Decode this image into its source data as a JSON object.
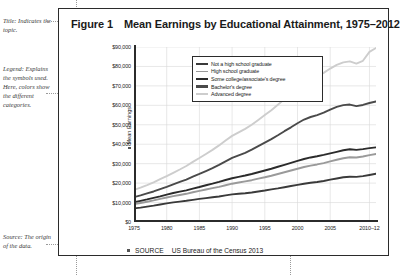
{
  "annotations": [
    {
      "id": "title-note",
      "label": "Title:",
      "text": "Indicates the topic."
    },
    {
      "id": "legend-note",
      "label": "Legend:",
      "text": "Explains the symbols used. Here, colors show the different categories."
    },
    {
      "id": "source-note",
      "label": "Source:",
      "text": "The origin of the data."
    }
  ],
  "figure": {
    "label": "Figure 1",
    "title": "Mean Earnings by Educational Attainment, 1975–2012",
    "source_word": "SOURCE",
    "source_text": "US Bureau of the Census 2013"
  },
  "chart_data": {
    "type": "line",
    "title": "Mean Earnings by Educational Attainment, 1975–2012",
    "xlabel": "",
    "ylabel": "Mean Earnings",
    "xlim": [
      1975,
      2012
    ],
    "ylim": [
      0,
      90000
    ],
    "grid": true,
    "legend_position": "top-left-inside",
    "ytick_labels": [
      "$90,000",
      "$80,000",
      "$70,000",
      "$60,000",
      "$50,000",
      "$40,000",
      "$30,000",
      "$20,000",
      "$10,000",
      "$0"
    ],
    "ytick_values": [
      90000,
      80000,
      70000,
      60000,
      50000,
      40000,
      30000,
      20000,
      10000,
      0
    ],
    "xtick_labels": [
      "1975",
      "1980",
      "1985",
      "1990",
      "1995",
      "2000",
      "2005",
      "2010–12"
    ],
    "xtick_values": [
      1975,
      1980,
      1985,
      1990,
      1995,
      2000,
      2005,
      2011
    ],
    "x": [
      1975,
      1976,
      1977,
      1978,
      1979,
      1980,
      1981,
      1982,
      1983,
      1984,
      1985,
      1986,
      1987,
      1988,
      1989,
      1990,
      1991,
      1992,
      1993,
      1994,
      1995,
      1996,
      1997,
      1998,
      1999,
      2000,
      2001,
      2002,
      2003,
      2004,
      2005,
      2006,
      2007,
      2008,
      2009,
      2010,
      2011,
      2012
    ],
    "series": [
      {
        "name": "Not a high school graduate",
        "color": "#3a3a3a",
        "values": [
          7000,
          7400,
          7900,
          8400,
          9000,
          9600,
          10100,
          10500,
          10900,
          11400,
          11900,
          12300,
          12700,
          13100,
          13700,
          14200,
          14500,
          14800,
          15200,
          15700,
          16200,
          16800,
          17300,
          17900,
          18500,
          19100,
          19700,
          20200,
          20600,
          21100,
          21800,
          22400,
          23000,
          23300,
          23200,
          23600,
          24200,
          24800
        ]
      },
      {
        "name": "High school graduate",
        "color": "#9a9a9a",
        "values": [
          9200,
          9800,
          10400,
          11100,
          11900,
          12600,
          13300,
          13900,
          14500,
          15300,
          16000,
          16700,
          17400,
          18100,
          18900,
          19700,
          20300,
          20900,
          21500,
          22300,
          23000,
          23800,
          24700,
          25600,
          26500,
          27400,
          28300,
          29000,
          29600,
          30300,
          31200,
          32000,
          32800,
          33300,
          33200,
          33700,
          34400,
          35000
        ]
      },
      {
        "name": "Some college/associate's degree",
        "color": "#2b2b2b",
        "values": [
          10200,
          10900,
          11600,
          12400,
          13200,
          14100,
          14900,
          15600,
          16300,
          17200,
          18000,
          18900,
          19700,
          20600,
          21600,
          22500,
          23200,
          23900,
          24700,
          25600,
          26500,
          27400,
          28400,
          29400,
          30400,
          31400,
          32400,
          33200,
          33800,
          34500,
          35300,
          36100,
          36900,
          37400,
          37100,
          37500,
          38000,
          38400
        ]
      },
      {
        "name": "Bachelor's degree",
        "color": "#4a4a4a",
        "values": [
          12800,
          13700,
          14700,
          15700,
          16900,
          18100,
          19400,
          20600,
          21800,
          23300,
          24700,
          26200,
          27700,
          29400,
          31200,
          33000,
          34300,
          35600,
          37200,
          39000,
          40800,
          42600,
          44600,
          46700,
          48700,
          50800,
          52700,
          54000,
          55000,
          56200,
          57800,
          59200,
          60100,
          60400,
          59600,
          60200,
          61200,
          62000
        ]
      },
      {
        "name": "Advanced degree",
        "color": "#cdcdcd",
        "values": [
          16500,
          17700,
          19000,
          20400,
          22000,
          23600,
          25300,
          27000,
          28800,
          30900,
          32900,
          35000,
          37100,
          39400,
          41900,
          44300,
          46100,
          47900,
          50000,
          52500,
          55000,
          57500,
          60300,
          63200,
          66000,
          69000,
          71800,
          73600,
          75000,
          76700,
          78900,
          80800,
          82100,
          82600,
          81500,
          82900,
          87500,
          89500
        ]
      }
    ]
  }
}
